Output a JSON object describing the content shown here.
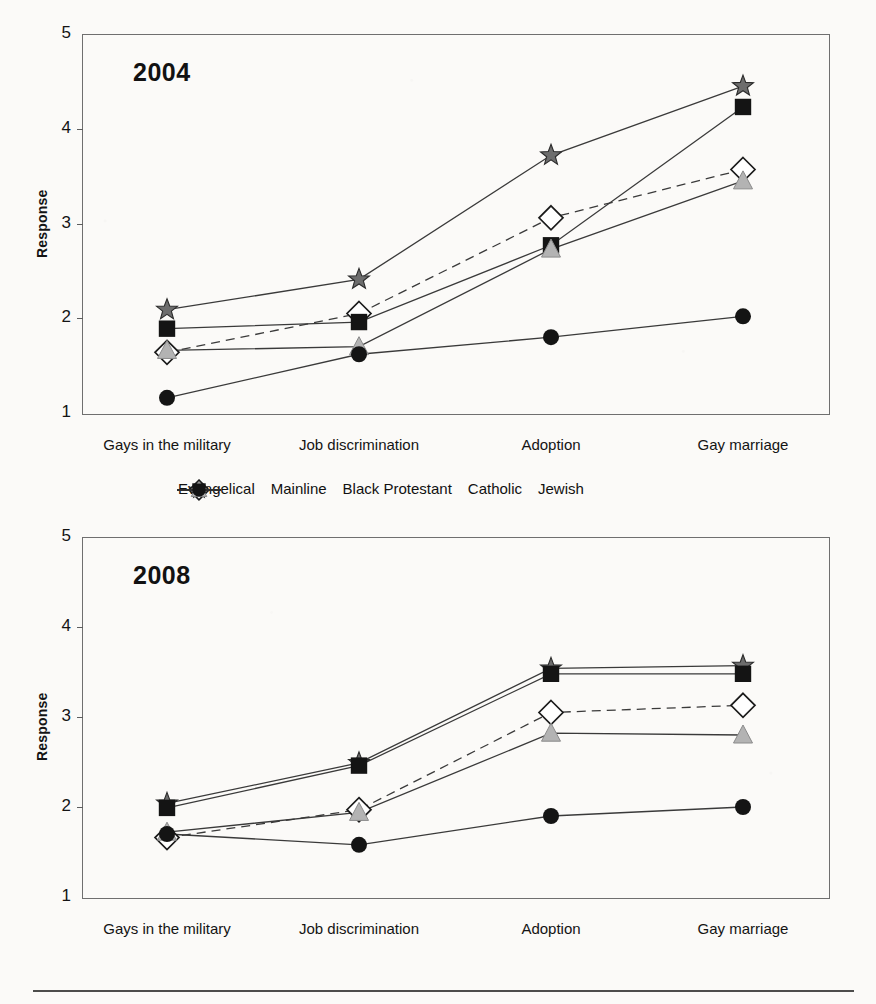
{
  "page": {
    "ghost_text": "",
    "footer_rule": true
  },
  "legend": {
    "position": "between-charts",
    "entries": [
      {
        "label": "Evangelical",
        "marker": "star-marker",
        "line": "solid",
        "color": "#6b6b6b"
      },
      {
        "label": "Mainline",
        "marker": "diamond-marker",
        "line": "dashed",
        "color": "#ffffff"
      },
      {
        "label": "Black Protestant",
        "marker": "square-marker",
        "line": "solid",
        "color": "#141414"
      },
      {
        "label": "Catholic",
        "marker": "triangle-marker",
        "line": "solid",
        "color": "#b0b0b0"
      },
      {
        "label": "Jewish",
        "marker": "circle-marker",
        "line": "solid",
        "color": "#141414"
      }
    ]
  },
  "chart_data": [
    {
      "type": "line",
      "title": "2004",
      "xlabel": "",
      "ylabel": "Response",
      "ylim": [
        1,
        5
      ],
      "yticks": [
        1,
        2,
        3,
        4,
        5
      ],
      "grid": false,
      "legend_position": "below",
      "categories": [
        "Gays in the military",
        "Job discrimination",
        "Adoption",
        "Gay marriage"
      ],
      "series": [
        {
          "name": "Evangelical",
          "marker": "star-marker",
          "line": "solid",
          "values": [
            2.09,
            2.41,
            3.72,
            4.45
          ]
        },
        {
          "name": "Mainline",
          "marker": "diamond-marker",
          "line": "dashed",
          "values": [
            1.64,
            2.05,
            3.06,
            3.57
          ]
        },
        {
          "name": "Black Protestant",
          "marker": "square-marker",
          "line": "solid",
          "values": [
            1.89,
            1.96,
            2.77,
            4.23
          ]
        },
        {
          "name": "Catholic",
          "marker": "triangle-marker",
          "line": "solid",
          "values": [
            1.66,
            1.7,
            2.73,
            3.45
          ]
        },
        {
          "name": "Jewish",
          "marker": "circle-marker",
          "line": "solid",
          "values": [
            1.16,
            1.62,
            1.8,
            2.02
          ]
        }
      ]
    },
    {
      "type": "line",
      "title": "2008",
      "xlabel": "",
      "ylabel": "Response",
      "ylim": [
        1,
        5
      ],
      "yticks": [
        1,
        2,
        3,
        4,
        5
      ],
      "grid": false,
      "legend_position": "above",
      "categories": [
        "Gays in the military",
        "Job discrimination",
        "Adoption",
        "Gay marriage"
      ],
      "series": [
        {
          "name": "Evangelical",
          "marker": "star-marker",
          "line": "solid",
          "values": [
            2.04,
            2.49,
            3.54,
            3.57
          ]
        },
        {
          "name": "Mainline",
          "marker": "diamond-marker",
          "line": "dashed",
          "values": [
            1.66,
            1.97,
            3.05,
            3.13
          ]
        },
        {
          "name": "Black Protestant",
          "marker": "square-marker",
          "line": "solid",
          "values": [
            1.99,
            2.46,
            3.48,
            3.48
          ]
        },
        {
          "name": "Catholic",
          "marker": "triangle-marker",
          "line": "solid",
          "values": [
            1.72,
            1.94,
            2.82,
            2.8
          ]
        },
        {
          "name": "Jewish",
          "marker": "circle-marker",
          "line": "solid",
          "values": [
            1.7,
            1.58,
            1.9,
            2.0
          ]
        }
      ]
    }
  ]
}
